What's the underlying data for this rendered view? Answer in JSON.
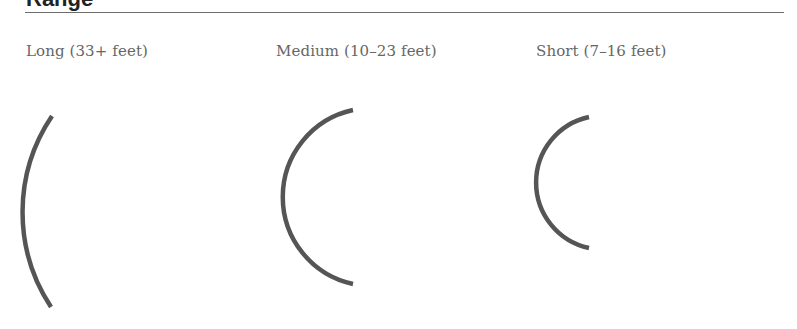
{
  "heading": {
    "text": "Range"
  },
  "categories": [
    {
      "id": "long",
      "label": "Long (33+ feet)",
      "arc": {
        "x1": 52,
        "y1": 116,
        "x2": 51,
        "y2": 307,
        "r": 172
      }
    },
    {
      "id": "medium",
      "label": "Medium (10–23 feet)",
      "arc": {
        "x1": 353,
        "y1": 110,
        "x2": 353,
        "y2": 284,
        "r": 89
      }
    },
    {
      "id": "short",
      "label": "Short (7–16 feet)",
      "arc": {
        "x1": 589,
        "y1": 117,
        "x2": 589,
        "y2": 248,
        "r": 67
      }
    }
  ],
  "style": {
    "arc_color": "#555555",
    "arc_width": 4.5,
    "rule_color": "#6d6d6d",
    "label_color": "#666666"
  }
}
